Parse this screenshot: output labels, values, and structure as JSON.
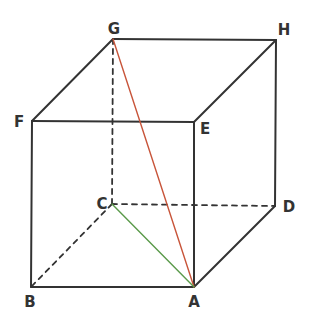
{
  "figure": {
    "type": "cube",
    "vertices": {
      "A": {
        "label": "A",
        "x": 194,
        "y": 287,
        "lx": 194,
        "ly": 307
      },
      "B": {
        "label": "B",
        "x": 31,
        "y": 287,
        "lx": 30,
        "ly": 307
      },
      "C": {
        "label": "C",
        "x": 112,
        "y": 204,
        "lx": 102,
        "ly": 209
      },
      "D": {
        "label": "D",
        "x": 275,
        "y": 206,
        "lx": 289,
        "ly": 212
      },
      "E": {
        "label": "E",
        "x": 194,
        "y": 122,
        "lx": 205,
        "ly": 134
      },
      "F": {
        "label": "F",
        "x": 32,
        "y": 121,
        "lx": 19,
        "ly": 127
      },
      "G": {
        "label": "G",
        "x": 113,
        "y": 39,
        "lx": 114,
        "ly": 34
      },
      "H": {
        "label": "H",
        "x": 276,
        "y": 40,
        "lx": 284,
        "ly": 35
      }
    },
    "solid_edges": [
      [
        "A",
        "B"
      ],
      [
        "B",
        "F"
      ],
      [
        "F",
        "E"
      ],
      [
        "E",
        "A"
      ],
      [
        "F",
        "G"
      ],
      [
        "G",
        "H"
      ],
      [
        "H",
        "E"
      ],
      [
        "H",
        "D"
      ],
      [
        "D",
        "A"
      ]
    ],
    "hidden_edges": [
      [
        "G",
        "C"
      ],
      [
        "C",
        "B"
      ],
      [
        "C",
        "D"
      ]
    ],
    "highlighted_segments": [
      {
        "from": "G",
        "to": "A",
        "color": "#c8553a",
        "name": "diagonal-GA"
      },
      {
        "from": "C",
        "to": "A",
        "color": "#5a9a4a",
        "name": "diagonal-CA"
      }
    ],
    "edge_color": "#333333"
  }
}
